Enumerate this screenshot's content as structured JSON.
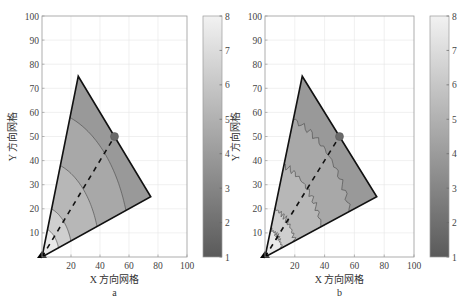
{
  "chart_data": [
    {
      "type": "heatmap",
      "panel_label": "a",
      "title": "",
      "xlabel": "X 方向网格",
      "ylabel": "Y 方向网格",
      "xlim": [
        0,
        100
      ],
      "ylim": [
        0,
        100
      ],
      "xticks": [
        20,
        40,
        60,
        80,
        100
      ],
      "yticks": [
        10,
        20,
        30,
        40,
        50,
        60,
        70,
        80,
        90,
        100
      ],
      "grid": true,
      "colorbar": {
        "min": 1,
        "max": 8,
        "ticks": [
          1,
          2,
          3,
          4,
          5,
          6,
          7,
          8
        ]
      },
      "domain_polygon": [
        [
          0,
          0
        ],
        [
          25,
          75
        ],
        [
          75,
          25
        ]
      ],
      "source_marker": {
        "shape": "triangle",
        "x": 0,
        "y": 0
      },
      "target_marker": {
        "shape": "circle",
        "x": 50,
        "y": 50
      },
      "dashed_line": [
        [
          0,
          0
        ],
        [
          50,
          50
        ]
      ],
      "contour_radii": [
        12,
        21,
        40,
        61
      ],
      "contour_style": "smooth",
      "bands": [
        {
          "r_max": 12,
          "value": 7.6
        },
        {
          "r_max": 21,
          "value": 6.4
        },
        {
          "r_max": 40,
          "value": 5.3
        },
        {
          "r_max": 61,
          "value": 4.6
        },
        {
          "r_max": 80,
          "value": 3.9
        }
      ]
    },
    {
      "type": "heatmap",
      "panel_label": "b",
      "title": "",
      "xlabel": "X 方向网格",
      "ylabel": "Y 方向网格",
      "xlim": [
        0,
        100
      ],
      "ylim": [
        0,
        100
      ],
      "xticks": [
        20,
        40,
        60,
        80,
        100
      ],
      "yticks": [
        10,
        20,
        30,
        40,
        50,
        60,
        70,
        80,
        90,
        100
      ],
      "grid": true,
      "colorbar": {
        "min": 1,
        "max": 8,
        "ticks": [
          1,
          2,
          3,
          4,
          5,
          6,
          7,
          8
        ]
      },
      "domain_polygon": [
        [
          0,
          0
        ],
        [
          25,
          75
        ],
        [
          75,
          25
        ]
      ],
      "source_marker": {
        "shape": "triangle",
        "x": 0,
        "y": 0
      },
      "target_marker": {
        "shape": "circle",
        "x": 50,
        "y": 50
      },
      "dashed_line": [
        [
          0,
          0
        ],
        [
          50,
          50
        ]
      ],
      "contour_radii": [
        12,
        21,
        40,
        60
      ],
      "contour_style": "jagged",
      "bands": [
        {
          "r_max": 12,
          "value": 7.6
        },
        {
          "r_max": 21,
          "value": 6.4
        },
        {
          "r_max": 40,
          "value": 5.3
        },
        {
          "r_max": 60,
          "value": 4.6
        },
        {
          "r_max": 80,
          "value": 3.9
        }
      ]
    }
  ],
  "panels": [
    {
      "label": "a",
      "xlabel": "X 方向网格",
      "ylabel": "Y 方向网格"
    },
    {
      "label": "b",
      "xlabel": "X 方向网格",
      "ylabel": "Y 方向网格"
    }
  ],
  "colors": {
    "grid": "#e6e6e6",
    "axis": "#9a9a9a",
    "edge": "#111111",
    "colormap_low": "#5a5a5a",
    "colormap_high": "#f2f2f2"
  }
}
